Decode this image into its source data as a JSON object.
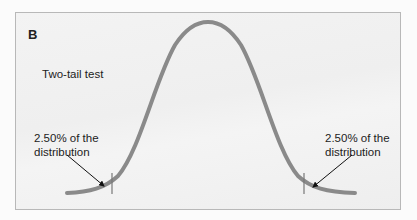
{
  "panel": {
    "label": "B",
    "title": "Two-tail test"
  },
  "annotations": {
    "left_tail_line1": "2.50% of the",
    "left_tail_line2": "distribution",
    "right_tail_line1": "2.50% of the",
    "right_tail_line2": "distribution"
  },
  "colors": {
    "curve": "#8a8a8a",
    "border": "#b8b8b8",
    "text": "#222222",
    "arrow": "#111111"
  }
}
